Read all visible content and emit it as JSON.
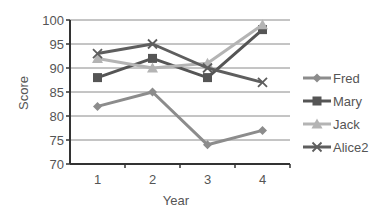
{
  "chart_data": {
    "type": "line",
    "title": "",
    "xlabel": "Year",
    "ylabel": "Score",
    "x": [
      1,
      2,
      3,
      4
    ],
    "categories": [
      "1",
      "2",
      "3",
      "4"
    ],
    "ylim": [
      70,
      100
    ],
    "yticks": [
      70,
      75,
      80,
      85,
      90,
      95,
      100
    ],
    "grid": "horizontal",
    "legend_position": "right",
    "series": [
      {
        "name": "Fred",
        "values": [
          82,
          85,
          74,
          77
        ],
        "color": "#8c8c8c",
        "marker": "diamond"
      },
      {
        "name": "Mary",
        "values": [
          88,
          92,
          88,
          98
        ],
        "color": "#555555",
        "marker": "square"
      },
      {
        "name": "Jack",
        "values": [
          92,
          90,
          91,
          99
        ],
        "color": "#b4b4b4",
        "marker": "triangle"
      },
      {
        "name": "Alice2",
        "values": [
          93,
          95,
          90,
          87
        ],
        "color": "#5e5e5e",
        "marker": "x"
      }
    ]
  },
  "labels": {
    "xlabel": "Year",
    "ylabel": "Score"
  }
}
